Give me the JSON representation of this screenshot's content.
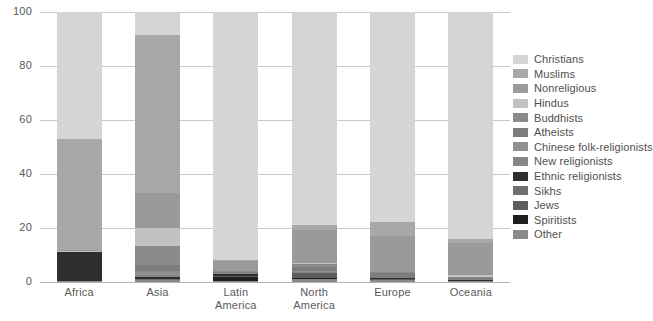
{
  "chart_data": {
    "type": "bar",
    "title": "",
    "xlabel": "",
    "ylabel": "",
    "ylim": [
      0,
      100
    ],
    "yticks": [
      0,
      20,
      40,
      60,
      80,
      100
    ],
    "grid": true,
    "stacked": true,
    "legend_position": "right",
    "categories": [
      "Africa",
      "Asia",
      "Latin America",
      "North America",
      "Europe",
      "Oceania"
    ],
    "series": [
      {
        "name": "Christians",
        "color": "#d5d5d5",
        "values": [
          47.0,
          8.5,
          92.0,
          79.0,
          77.5,
          84.0
        ]
      },
      {
        "name": "Muslims",
        "color": "#a8a8a8",
        "values": [
          41.0,
          59.0,
          0.3,
          1.8,
          5.5,
          1.5
        ]
      },
      {
        "name": "Nonreligious",
        "color": "#9a9a9a",
        "values": [
          0.6,
          13.0,
          3.5,
          12.0,
          13.0,
          12.0
        ]
      },
      {
        "name": "Hindus",
        "color": "#c2c2c2",
        "values": [
          0.2,
          6.5,
          0.2,
          0.6,
          0.3,
          0.5
        ]
      },
      {
        "name": "Buddhists",
        "color": "#8b8b8b",
        "values": [
          0.0,
          7.0,
          0.2,
          1.0,
          0.3,
          0.4
        ]
      },
      {
        "name": "Atheists",
        "color": "#7d7d7d",
        "values": [
          0.1,
          2.5,
          0.5,
          1.6,
          1.7,
          0.4
        ]
      },
      {
        "name": "Chinese folk-religionists",
        "color": "#8f8f8f",
        "values": [
          0.0,
          1.5,
          0.1,
          0.2,
          0.1,
          0.2
        ]
      },
      {
        "name": "New religionists",
        "color": "#868686",
        "values": [
          0.0,
          0.8,
          0.1,
          0.3,
          0.1,
          0.2
        ]
      },
      {
        "name": "Ethnic religionists",
        "color": "#2e2e2e",
        "values": [
          10.8,
          0.5,
          1.0,
          0.1,
          0.1,
          0.3
        ]
      },
      {
        "name": "Sikhs",
        "color": "#6f6f6f",
        "values": [
          0.0,
          0.5,
          0.0,
          0.2,
          0.1,
          0.1
        ]
      },
      {
        "name": "Jews",
        "color": "#5e5e5e",
        "values": [
          0.0,
          0.1,
          0.2,
          1.8,
          0.5,
          0.1
        ]
      },
      {
        "name": "Spiritists",
        "color": "#1f1f1f",
        "values": [
          0.0,
          0.0,
          1.5,
          0.1,
          0.1,
          0.0
        ]
      },
      {
        "name": "Other",
        "color": "#8a8a8a",
        "values": [
          0.3,
          0.6,
          0.4,
          1.3,
          0.6,
          0.3
        ]
      }
    ]
  },
  "axis": {
    "yticks": [
      "0",
      "20",
      "40",
      "60",
      "80",
      "100"
    ]
  },
  "xlabels": [
    {
      "line1": "Africa",
      "line2": ""
    },
    {
      "line1": "Asia",
      "line2": ""
    },
    {
      "line1": "Latin",
      "line2": "America"
    },
    {
      "line1": "North",
      "line2": "America"
    },
    {
      "line1": "Europe",
      "line2": ""
    },
    {
      "line1": "Oceania",
      "line2": ""
    }
  ],
  "colors": {
    "gridline": "#c9c9c9",
    "axis": "#b2b2b2",
    "text": "#595959",
    "background": "#ffffff"
  }
}
